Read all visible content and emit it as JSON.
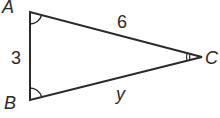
{
  "diagram": {
    "type": "triangle",
    "vertices": {
      "A": {
        "label": "A",
        "x": 30,
        "y": 12
      },
      "B": {
        "label": "B",
        "x": 30,
        "y": 100
      },
      "C": {
        "label": "C",
        "x": 202,
        "y": 57
      }
    },
    "sides": {
      "AB": {
        "label": "3"
      },
      "AC": {
        "label": "6"
      },
      "BC": {
        "label": "y"
      }
    },
    "angle_marks": {
      "A": "single-arc",
      "B": "single-arc",
      "C": "double-arc"
    },
    "colors": {
      "stroke": "#2a2a2a",
      "background": "#ffffff"
    }
  }
}
